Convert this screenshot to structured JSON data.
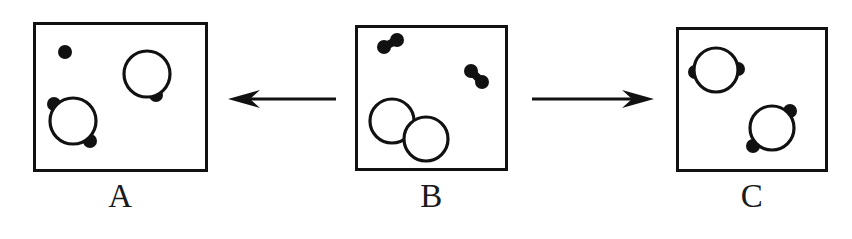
{
  "figure": {
    "width": 852,
    "height": 239,
    "background": "#ffffff",
    "ink_color": "#111111"
  },
  "panels": [
    {
      "id": "A",
      "label": "A",
      "box": {
        "x": 33,
        "y": 22,
        "width": 175,
        "height": 150
      },
      "label_position": {
        "x": 33,
        "y": 180,
        "width": 175
      },
      "circles": [
        {
          "name": "lower-left-ring",
          "cx": 73,
          "cy": 121,
          "r": 23,
          "dots": [
            {
              "name": "upper-left-dot",
              "cx": 54,
              "cy": 104,
              "r": 7
            },
            {
              "name": "lower-right-dot",
              "cx": 90,
              "cy": 141,
              "r": 7
            }
          ]
        },
        {
          "name": "upper-right-ring",
          "cx": 147,
          "cy": 74,
          "r": 23,
          "dots": [
            {
              "name": "lower-right-dot",
              "cx": 156,
              "cy": 95,
              "r": 7
            }
          ]
        }
      ],
      "free_dots": [
        {
          "name": "isolated-dot",
          "cx": 65,
          "cy": 52,
          "r": 7
        }
      ]
    },
    {
      "id": "B",
      "label": "B",
      "box": {
        "x": 355,
        "y": 25,
        "width": 153,
        "height": 146
      },
      "label_position": {
        "x": 355,
        "y": 180,
        "width": 153
      },
      "circles": [
        {
          "name": "upper-left-ring",
          "cx": 392,
          "cy": 121,
          "r": 22,
          "dots": []
        },
        {
          "name": "lower-right-ring",
          "cx": 426,
          "cy": 139,
          "r": 22,
          "dots": []
        }
      ],
      "dot_pairs": [
        {
          "name": "upper-left-dot-pair",
          "dots": [
            {
              "cx": 384,
              "cy": 47,
              "r": 7
            },
            {
              "cx": 397,
              "cy": 40,
              "r": 7
            }
          ]
        },
        {
          "name": "right-dot-pair",
          "dots": [
            {
              "cx": 471,
              "cy": 71,
              "r": 7
            },
            {
              "cx": 482,
              "cy": 82,
              "r": 7
            }
          ]
        }
      ],
      "free_dots": []
    },
    {
      "id": "C",
      "label": "C",
      "box": {
        "x": 676,
        "y": 27,
        "width": 152,
        "height": 145
      },
      "label_position": {
        "x": 676,
        "y": 180,
        "width": 152
      },
      "circles": [
        {
          "name": "upper-left-ring",
          "cx": 716,
          "cy": 70,
          "r": 22,
          "dots": [
            {
              "name": "left-dot",
              "cx": 695,
              "cy": 72,
              "r": 7
            },
            {
              "name": "right-dot",
              "cx": 738,
              "cy": 69,
              "r": 7
            }
          ]
        },
        {
          "name": "lower-right-ring",
          "cx": 772,
          "cy": 128,
          "r": 22,
          "dots": [
            {
              "name": "upper-right-dot",
              "cx": 790,
              "cy": 111,
              "r": 7
            },
            {
              "name": "lower-left-dot",
              "cx": 753,
              "cy": 146,
              "r": 7
            }
          ]
        }
      ],
      "free_dots": []
    }
  ],
  "arrows": [
    {
      "name": "arrow-b-to-a",
      "direction": "left",
      "x": 228,
      "y": 86,
      "width": 108,
      "height": 26
    },
    {
      "name": "arrow-b-to-c",
      "direction": "right",
      "x": 532,
      "y": 86,
      "width": 122,
      "height": 26
    }
  ]
}
